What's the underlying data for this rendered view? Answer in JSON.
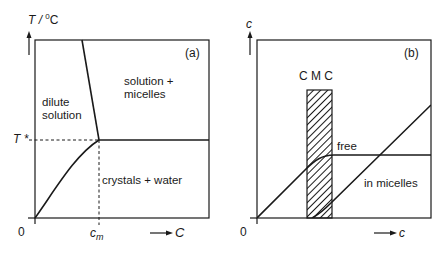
{
  "colors": {
    "ink": "#1a1a1a",
    "background": "#ffffff"
  },
  "panel_a": {
    "tag": "(a)",
    "y_axis_label": "T / ",
    "y_axis_unit_sup": "0",
    "y_axis_unit": "C",
    "x_axis_label": "C",
    "origin_label": "0",
    "t_star_label": "T *",
    "cm_label": "c",
    "cm_subscript": "m",
    "regions": {
      "dilute_line1": "dilute",
      "dilute_line2": "solution",
      "solution_micelles_line1": "solution +",
      "solution_micelles_line2": "micelles",
      "crystals_water": "crystals + water"
    }
  },
  "panel_b": {
    "tag": "(b)",
    "y_axis_label": "c",
    "x_axis_label": "c",
    "origin_label": "0",
    "cmc_label": "C M C",
    "curves": {
      "free": "free",
      "in_micelles": "in micelles"
    }
  }
}
